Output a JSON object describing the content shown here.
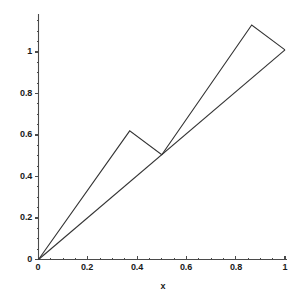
{
  "figure": {
    "background_color": "#ffffff",
    "line_color": "#333333",
    "axis_color": "#4a4a4a",
    "text_color": "#1a1a1a",
    "width": 301,
    "height": 302
  },
  "axes": {
    "x_label": "x",
    "y_label": "",
    "x_ticks": [
      "0",
      "0.2",
      "0.4",
      "0.6",
      "0.8",
      "1"
    ],
    "y_ticks": [
      "0",
      "0.2",
      "0.4",
      "0.6",
      "0.8",
      "1"
    ]
  },
  "chart_data": {
    "type": "line",
    "title": "",
    "xlabel": "x",
    "ylabel": "",
    "xlim": [
      0,
      1
    ],
    "ylim": [
      0,
      1.2
    ],
    "grid": false,
    "legend": "none",
    "x_ticks": [
      0,
      0.2,
      0.4,
      0.6,
      0.8,
      1
    ],
    "y_ticks": [
      0,
      0.2,
      0.4,
      0.6,
      0.8,
      1
    ],
    "x_tick_labels": [
      "0",
      "0.2",
      "0.4",
      "0.6",
      "0.8",
      "1"
    ],
    "y_tick_labels": [
      "0",
      "0.2",
      "0.4",
      "0.6",
      "0.8",
      "1"
    ],
    "minor_ticks": true,
    "series": [
      {
        "name": "zigzag",
        "type": "line",
        "x": [
          0,
          0.37,
          0.5,
          0.865,
          1
        ],
        "y": [
          0,
          0.62,
          0.505,
          1.13,
          1.01
        ]
      },
      {
        "name": "diagonal",
        "type": "line",
        "x": [
          0,
          1
        ],
        "y": [
          0,
          1.01
        ]
      }
    ]
  }
}
